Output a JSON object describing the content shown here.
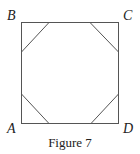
{
  "figure": {
    "caption": "Figure 7",
    "stroke_color": "#555555",
    "vertices": {
      "A": {
        "label": "A"
      },
      "B": {
        "label": "B"
      },
      "C": {
        "label": "C"
      },
      "D": {
        "label": "D"
      }
    },
    "shape": "square ABCD with four congruent corner triangles cut off, forming an inscribed octagon"
  }
}
